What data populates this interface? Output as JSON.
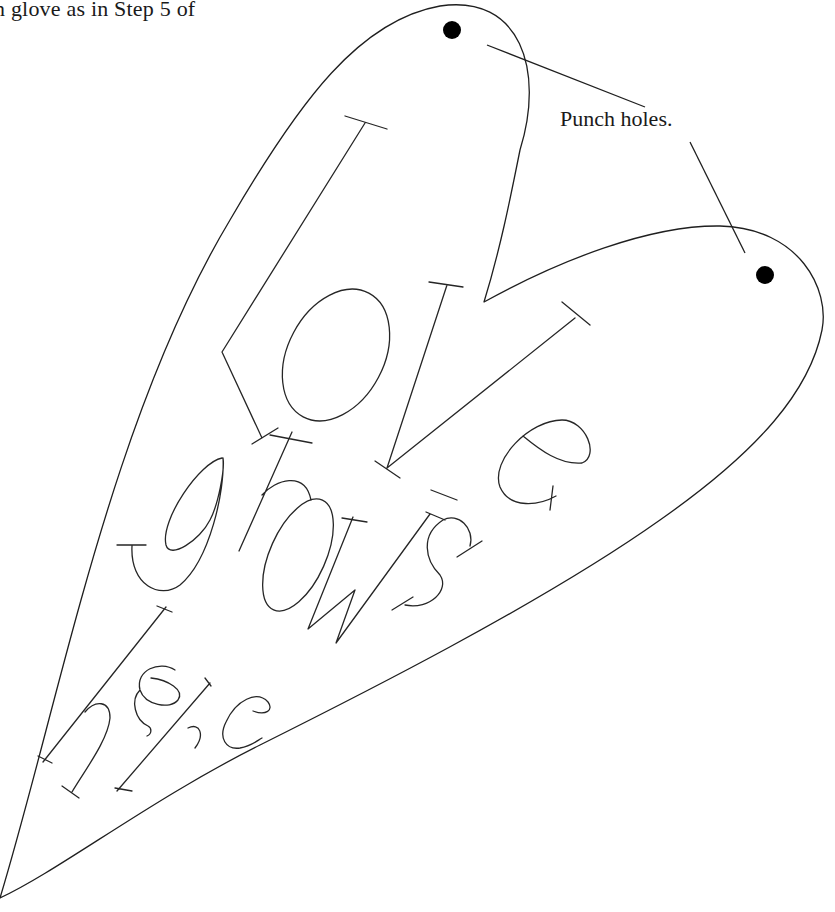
{
  "page": {
    "instruction_text": "n glove as in Step 5 of",
    "callout": {
      "label": "Punch holes.",
      "targets": [
        "punch-hole-top",
        "punch-hole-right"
      ]
    },
    "pattern": {
      "shape": "heart-template",
      "lettering": {
        "line_1": "love",
        "line_2": "grows",
        "line_3": "here"
      },
      "colors": {
        "stroke": "#1f1f1f",
        "hole_fill": "#000000",
        "background": "#ffffff"
      }
    }
  }
}
